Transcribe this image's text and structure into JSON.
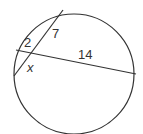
{
  "figure": {
    "type": "geometry-diagram",
    "labels": {
      "segment_a": "2",
      "segment_b": "7",
      "segment_c": "14",
      "segment_x": "x"
    },
    "colors": {
      "stroke": "#333333",
      "background": "#ffffff"
    }
  }
}
